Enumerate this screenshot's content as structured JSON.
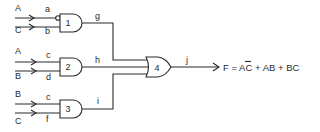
{
  "diagram": {
    "type": "logic-circuit",
    "gates": [
      {
        "id": "1",
        "kind": "AND",
        "inverted_input": "a",
        "inputs": [
          "a",
          "b"
        ],
        "output": "g"
      },
      {
        "id": "2",
        "kind": "AND",
        "inputs": [
          "c",
          "d"
        ],
        "output": "h"
      },
      {
        "id": "3",
        "kind": "AND",
        "inputs": [
          "c",
          "f"
        ],
        "output": "i"
      },
      {
        "id": "4",
        "kind": "OR",
        "inputs": [
          "g",
          "h",
          "i"
        ],
        "output": "j"
      }
    ],
    "inputs": [
      {
        "signal": "A",
        "wire": "a",
        "gate": "1"
      },
      {
        "signal": "C",
        "wire": "b",
        "gate": "1"
      },
      {
        "signal": "A",
        "wire": "c",
        "gate": "2"
      },
      {
        "signal": "B",
        "wire": "d",
        "gate": "2"
      },
      {
        "signal": "B",
        "wire": "c",
        "gate": "3"
      },
      {
        "signal": "C",
        "wire": "f",
        "gate": "3"
      }
    ],
    "labels": {
      "g1_in1_signal": "A",
      "g1_in1_wire": "a",
      "g1_in2_signal": "C",
      "g1_in2_wire": "b",
      "g2_in1_signal": "A",
      "g2_in1_wire": "c",
      "g2_in2_signal": "B",
      "g2_in2_wire": "d",
      "g3_in1_signal": "B",
      "g3_in1_wire": "c",
      "g3_in2_signal": "C",
      "g3_in2_wire": "f",
      "gate1": "1",
      "gate2": "2",
      "gate3": "3",
      "gate4": "4",
      "out_g": "g",
      "out_h": "h",
      "out_i": "i",
      "out_j": "j"
    },
    "output_expression": {
      "prefix": "F = ",
      "term1_bar": "A",
      "term1_rest": "C",
      "rest": " + AB + BC"
    }
  }
}
